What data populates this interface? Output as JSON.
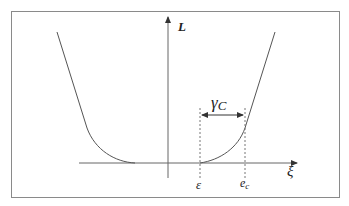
{
  "diagram": {
    "type": "loss-function-plot",
    "axes": {
      "y_label": "L",
      "x_label": "ξ"
    },
    "annotations": {
      "width_label": "γ",
      "width_label_sub": "C",
      "left_marker": "ε",
      "right_marker": "e",
      "right_marker_sub": "c"
    },
    "colors": {
      "frame": "#8a8a8a",
      "curve": "#555555",
      "axis": "#666666",
      "dashed": "#777777",
      "text": "#222222"
    }
  }
}
